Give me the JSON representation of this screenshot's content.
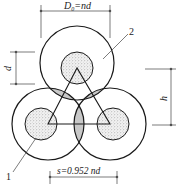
{
  "diagram": {
    "type": "cross-section of three overlapping circular elements arranged in a triangle",
    "labels": {
      "outer_diameter": "D",
      "outer_diameter_sub": "0",
      "outer_diameter_eq": "=nd",
      "inner_diameter": "d",
      "height": "h",
      "spacing": "s=0.952 nd",
      "callout_1": "1",
      "callout_2": "2"
    },
    "colors": {
      "stroke": "#1a1a1a",
      "dim_line": "#555555",
      "fill_dots": "#888888"
    }
  }
}
